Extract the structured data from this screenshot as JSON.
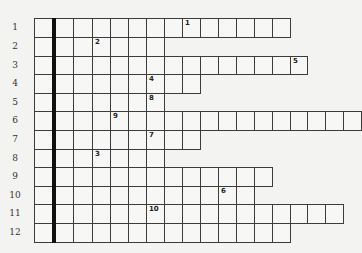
{
  "puzzle": {
    "type": "crossword",
    "layout": {
      "column_edges": [
        34,
        53,
        73,
        92,
        110,
        128,
        146,
        164,
        182,
        200,
        218,
        236,
        254,
        272,
        290,
        307,
        325,
        343,
        361
      ],
      "row_edges": [
        18,
        37,
        56,
        74,
        93,
        111,
        130,
        149,
        167,
        186,
        204,
        223,
        242
      ],
      "highlight_column": 1
    },
    "rows": [
      {
        "label": "1",
        "length": 14,
        "clues": [
          {
            "col": 8,
            "number": "1"
          }
        ]
      },
      {
        "label": "2",
        "length": 7,
        "clues": [
          {
            "col": 3,
            "number": "2"
          }
        ]
      },
      {
        "label": "3",
        "length": 15,
        "clues": [
          {
            "col": 14,
            "number": "5"
          }
        ]
      },
      {
        "label": "4",
        "length": 9,
        "clues": [
          {
            "col": 6,
            "number": "4"
          }
        ]
      },
      {
        "label": "5",
        "length": 7,
        "clues": [
          {
            "col": 6,
            "number": "8"
          }
        ]
      },
      {
        "label": "6",
        "length": 18,
        "clues": [
          {
            "col": 4,
            "number": "9"
          }
        ]
      },
      {
        "label": "7",
        "length": 9,
        "clues": [
          {
            "col": 6,
            "number": "7"
          }
        ]
      },
      {
        "label": "8",
        "length": 7,
        "clues": [
          {
            "col": 3,
            "number": "3"
          }
        ]
      },
      {
        "label": "9",
        "length": 13,
        "clues": []
      },
      {
        "label": "10",
        "length": 12,
        "clues": [
          {
            "col": 10,
            "number": "6"
          }
        ]
      },
      {
        "label": "11",
        "length": 17,
        "clues": [
          {
            "col": 6,
            "number": "10"
          }
        ]
      },
      {
        "label": "12",
        "length": 14,
        "clues": []
      }
    ]
  }
}
